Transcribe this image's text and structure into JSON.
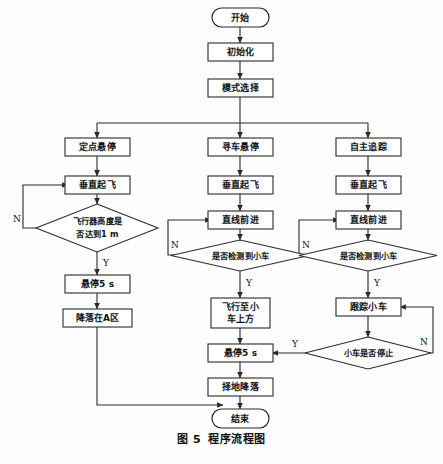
{
  "figure": {
    "caption_number": "图 5",
    "caption_title": "程序流程图"
  },
  "colors": {
    "stroke": "#2b2b2b",
    "fill": "#ffffff",
    "text": "#131313",
    "background": "#fdfdfd"
  },
  "nodes": {
    "start": {
      "label": "开始",
      "type": "terminal"
    },
    "init": {
      "label": "初始化",
      "type": "process"
    },
    "mode_select": {
      "label": "模式选择",
      "type": "process"
    },
    "branch_a_mode": {
      "label": "定点悬停",
      "type": "process"
    },
    "branch_a_takeoff": {
      "label": "垂直起飞",
      "type": "process"
    },
    "branch_a_decision": {
      "label_line1": "飞行器高度是",
      "label_line2": "否达到1 m",
      "type": "decision"
    },
    "branch_a_hover": {
      "label": "悬停5 s",
      "type": "process"
    },
    "branch_a_land": {
      "label": "降落在A区",
      "type": "process"
    },
    "branch_b_mode": {
      "label": "寻车悬停",
      "type": "process"
    },
    "branch_b_takeoff": {
      "label": "垂直起飞",
      "type": "process"
    },
    "branch_b_forward": {
      "label": "直线前进",
      "type": "process"
    },
    "branch_b_decision": {
      "label": "是否检测到小车",
      "type": "decision"
    },
    "branch_b_flyover": {
      "label_line1": "飞行至小",
      "label_line2": "车上方",
      "type": "process"
    },
    "branch_b_hover": {
      "label": "悬停5 s",
      "type": "process"
    },
    "branch_b_land": {
      "label": "择地降落",
      "type": "process"
    },
    "branch_c_mode": {
      "label": "自主追踪",
      "type": "process"
    },
    "branch_c_takeoff": {
      "label": "垂直起飞",
      "type": "process"
    },
    "branch_c_forward": {
      "label": "直线前进",
      "type": "process"
    },
    "branch_c_decision": {
      "label": "是否检测到小车",
      "type": "decision"
    },
    "branch_c_track": {
      "label": "跟踪小车",
      "type": "process"
    },
    "branch_c_stop_decision": {
      "label": "小车是否停止",
      "type": "decision"
    },
    "end": {
      "label": "结束",
      "type": "terminal"
    }
  },
  "edge_labels": {
    "a_no": "N",
    "a_yes": "Y",
    "b_no": "N",
    "b_yes": "Y",
    "c_no": "N",
    "c_yes": "Y",
    "c_stop_no": "N",
    "c_stop_yes": "Y"
  }
}
